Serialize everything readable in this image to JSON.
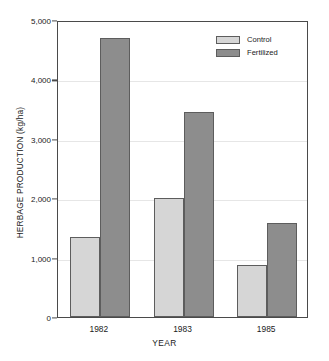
{
  "chart_data": {
    "type": "bar",
    "title": "",
    "subtitle": "",
    "xlabel": "YEAR",
    "ylabel": "HERBAGE PRODUCTION (kg/ha)",
    "categories": [
      "1982",
      "1983",
      "1985"
    ],
    "series": [
      {
        "name": "Control",
        "values": [
          1350,
          2000,
          870
        ],
        "color": "#d6d6d6"
      },
      {
        "name": "Fertilized",
        "values": [
          4700,
          3450,
          1590
        ],
        "color": "#8d8d8d"
      }
    ],
    "ylim": [
      0,
      5000
    ],
    "ytick_values": [
      0,
      1000,
      2000,
      3000,
      4000,
      5000
    ],
    "ytick_labels": [
      "0",
      "1,000",
      "2,000",
      "3,000",
      "4,000",
      "5,000"
    ],
    "grid": true,
    "grid_axis": "y",
    "legend_position": "top-right",
    "legend_entries": [
      "Control",
      "Fertilized"
    ],
    "annotations": []
  },
  "axes": {
    "y_title": "HERBAGE PRODUCTION (kg/ha)",
    "x_title": "YEAR"
  },
  "legend": {
    "entries": [
      {
        "label": "Control",
        "color": "#d6d6d6"
      },
      {
        "label": "Fertilized",
        "color": "#8d8d8d"
      }
    ]
  },
  "colors": {
    "control": "#d6d6d6",
    "fertilized": "#8d8d8d",
    "axis": "#4a4a4a",
    "grid": "#e6e6e6",
    "bar_outline": "#5d5d5d",
    "background": "#ffffff",
    "text": "#1a1a1a"
  }
}
